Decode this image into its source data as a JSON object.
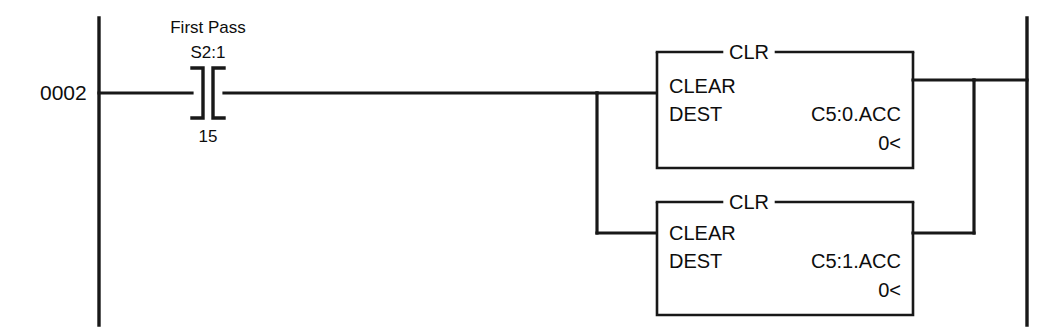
{
  "diagram": {
    "type": "ladder-logic-rung",
    "rung_number": "0002",
    "left_rail": "power-rail-left",
    "right_rail": "power-rail-right"
  },
  "contact": {
    "symbol_type": "XIC",
    "description": "First Pass",
    "address": "S2:1",
    "bit": "15"
  },
  "blocks": [
    {
      "title": "CLR",
      "instruction": "CLEAR",
      "operand_label": "DEST",
      "operand_value": "C5:0.ACC",
      "current_value": "0<"
    },
    {
      "title": "CLR",
      "instruction": "CLEAR",
      "operand_label": "DEST",
      "operand_value": "C5:1.ACC",
      "current_value": "0<"
    }
  ],
  "colors": {
    "ink": "#181818",
    "background": "#ffffff"
  }
}
